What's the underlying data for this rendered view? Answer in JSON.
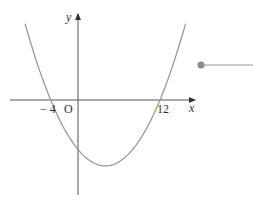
{
  "diagram": {
    "type": "parabola-graph",
    "axes": {
      "x_label": "x",
      "y_label": "y",
      "origin_label": "O"
    },
    "function": {
      "form": "y = a(x + 4)(x - 12)",
      "roots": [
        -4,
        12
      ],
      "vertex_x": 4,
      "opens": "up"
    },
    "tick_labels": [
      {
        "text": "− 4",
        "value": -4
      },
      {
        "text": "12",
        "value": 12
      }
    ],
    "colors": {
      "curve": "#9a9a9a",
      "axis": "#555555",
      "pointer": "#8a8a8a"
    }
  }
}
